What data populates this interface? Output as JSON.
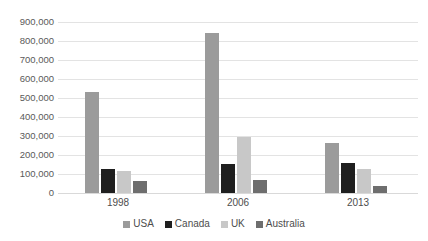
{
  "chart_data": {
    "type": "bar",
    "title": "",
    "subtitle": "",
    "xlabel": "",
    "ylabel": "",
    "categories": [
      "1998",
      "2006",
      "2013"
    ],
    "series": [
      {
        "name": "USA",
        "color": "#9b9b9b",
        "values": [
          530000,
          840000,
          265000
        ]
      },
      {
        "name": "Canada",
        "color": "#1f1f1f",
        "values": [
          125000,
          155000,
          160000
        ]
      },
      {
        "name": "UK",
        "color": "#c8c8c8",
        "values": [
          118000,
          295000,
          125000
        ]
      },
      {
        "name": "Australia",
        "color": "#6e6e6e",
        "values": [
          65000,
          67000,
          38000
        ]
      }
    ],
    "ylim": [
      0,
      900000
    ],
    "ytick_step": 100000,
    "ytick_labels": [
      "0",
      "100,000",
      "200,000",
      "300,000",
      "400,000",
      "500,000",
      "600,000",
      "700,000",
      "800,000",
      "900,000"
    ],
    "ytick_values": [
      0,
      100000,
      200000,
      300000,
      400000,
      500000,
      600000,
      700000,
      800000,
      900000
    ],
    "grid": true,
    "legend_position": "bottom"
  },
  "style": {
    "background": "#ffffff",
    "gridline_color": "#e3e3e3",
    "axis_text_color": "#4d4d4d"
  }
}
